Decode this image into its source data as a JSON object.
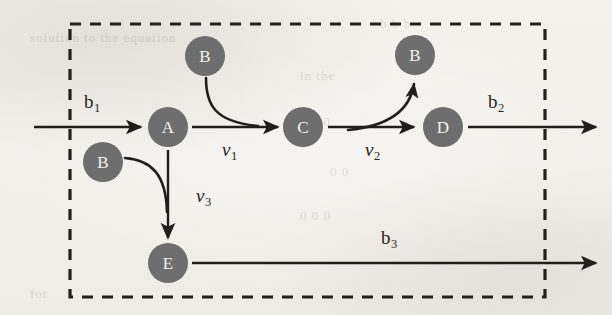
{
  "diagram": {
    "type": "metabolic-pathway-flux-diagram",
    "colors": {
      "node_fill": "#6e6e6e",
      "node_text": "#f4f2ee",
      "stroke": "#211e1b",
      "background": "#f3f1ec",
      "boundary": "#23201d"
    },
    "system_boundary": {
      "label": "system-boundary",
      "style": "dashed",
      "x": 70,
      "y": 24,
      "width": 475,
      "height": 273
    },
    "nodes": [
      {
        "id": "A",
        "label": "A",
        "cx": 168,
        "cy": 127,
        "r": 20
      },
      {
        "id": "C",
        "label": "C",
        "cx": 303,
        "cy": 127,
        "r": 20
      },
      {
        "id": "D",
        "label": "D",
        "cx": 443,
        "cy": 127,
        "r": 20
      },
      {
        "id": "E",
        "label": "E",
        "cx": 168,
        "cy": 263,
        "r": 20
      },
      {
        "id": "B1",
        "label": "B",
        "cx": 205,
        "cy": 56,
        "r": 20
      },
      {
        "id": "B2",
        "label": "B",
        "cx": 415,
        "cy": 55,
        "r": 20
      },
      {
        "id": "B3",
        "label": "B",
        "cx": 103,
        "cy": 162,
        "r": 20
      }
    ],
    "boundary_fluxes": [
      {
        "id": "b1",
        "symbol": "b",
        "subscript": "1",
        "x": 84,
        "y": 92,
        "direction": "in",
        "description": "input flux into A"
      },
      {
        "id": "b2",
        "symbol": "b",
        "subscript": "2",
        "x": 488,
        "y": 92,
        "direction": "out",
        "description": "output flux from D"
      },
      {
        "id": "b3",
        "symbol": "b",
        "subscript": "3",
        "x": 381,
        "y": 228,
        "direction": "out",
        "description": "output flux from E"
      }
    ],
    "reaction_rates": [
      {
        "id": "v1",
        "symbol": "ν",
        "subscript": "1",
        "x": 222,
        "y": 140,
        "from": "A",
        "to": "C",
        "cofactor": "B1",
        "cofactor_role": "consumed"
      },
      {
        "id": "v2",
        "symbol": "ν",
        "subscript": "2",
        "x": 365,
        "y": 140,
        "from": "C",
        "to": "D",
        "cofactor": "B2",
        "cofactor_role": "produced"
      },
      {
        "id": "v3",
        "symbol": "ν",
        "subscript": "3",
        "x": 196,
        "y": 186,
        "from": "A",
        "to": "E",
        "cofactor": "B3",
        "cofactor_role": "consumed"
      }
    ],
    "bleed_through_text": [
      {
        "text": "solution to the equation",
        "x": 30,
        "y": 36
      },
      {
        "text": "b  b  b",
        "x": 380,
        "y": 22
      },
      {
        "text": "in the",
        "x": 300,
        "y": 74
      },
      {
        "text": "0     0     0",
        "x": 300,
        "y": 120
      },
      {
        "text": "0     0",
        "x": 330,
        "y": 170
      },
      {
        "text": "0     0     0",
        "x": 300,
        "y": 214
      },
      {
        "text": "for",
        "x": 30,
        "y": 292
      }
    ]
  }
}
